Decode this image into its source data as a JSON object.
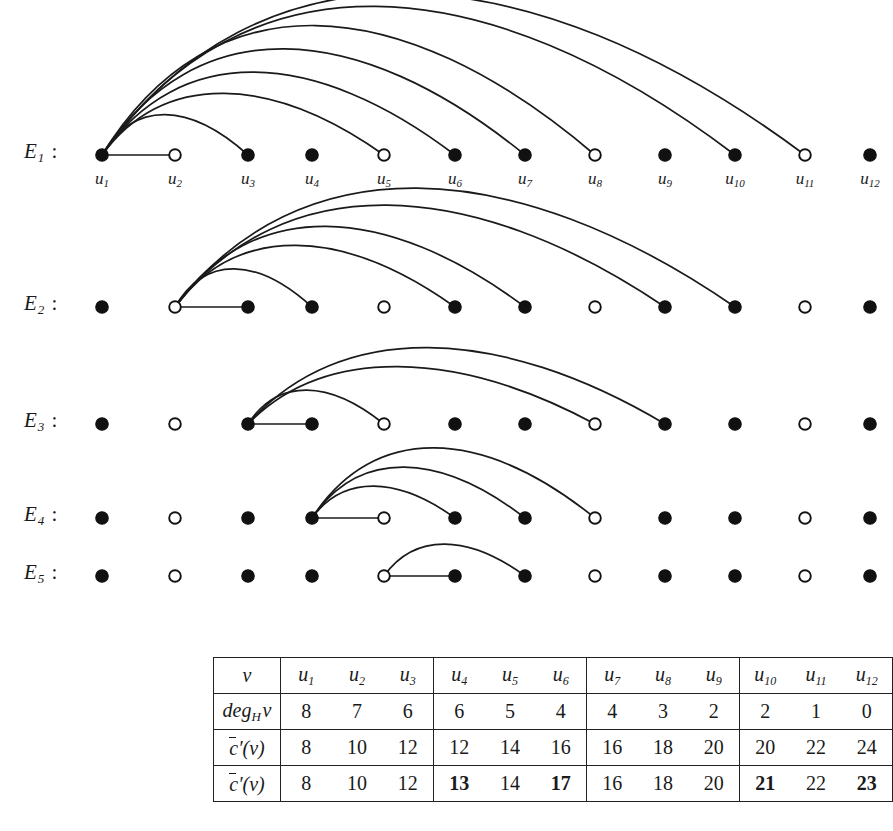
{
  "figure": {
    "vertex_labels": [
      "u1",
      "u2",
      "u3",
      "u4",
      "u5",
      "u6",
      "u7",
      "u8",
      "u9",
      "u10",
      "u11",
      "u12"
    ],
    "vertex_label_base": "u",
    "vertex_label_subs": [
      "1",
      "2",
      "3",
      "4",
      "5",
      "6",
      "7",
      "8",
      "9",
      "10",
      "11",
      "12"
    ],
    "vertex_x": [
      102,
      175,
      248,
      312,
      384,
      455,
      525,
      595,
      665,
      735,
      805,
      870
    ],
    "vertex_fill": [
      "filled",
      "open",
      "filled",
      "filled",
      "open",
      "filled",
      "filled",
      "open",
      "filled",
      "filled",
      "open",
      "filled"
    ],
    "node_colors": {
      "filled": "#111111",
      "open": "#ffffff",
      "stroke": "#111111"
    },
    "edge_color": "#1a1a1a",
    "rows": [
      {
        "id": "E1",
        "label_base": "E",
        "label_sub": "1",
        "colon": ":",
        "baseline_y": 155,
        "source_index": 0,
        "straight_targets": [
          1
        ],
        "arc_targets": [
          2,
          4,
          5,
          6,
          7,
          9,
          10
        ],
        "arc_apex_offsets": [
          38,
          58,
          78,
          100,
          122,
          140,
          152
        ]
      },
      {
        "id": "E2",
        "label_base": "E",
        "label_sub": "2",
        "colon": ":",
        "baseline_y": 307,
        "source_index": 1,
        "straight_targets": [
          2
        ],
        "arc_targets": [
          3,
          5,
          6,
          8,
          9
        ],
        "arc_apex_offsets": [
          36,
          58,
          76,
          96,
          112
        ]
      },
      {
        "id": "E3",
        "label_base": "E",
        "label_sub": "3",
        "colon": ":",
        "baseline_y": 424,
        "source_index": 2,
        "straight_targets": [
          3
        ],
        "arc_targets": [
          4,
          7,
          8
        ],
        "arc_apex_offsets": [
          32,
          54,
          72
        ]
      },
      {
        "id": "E4",
        "label_base": "E",
        "label_sub": "4",
        "colon": ":",
        "baseline_y": 518,
        "source_index": 3,
        "straight_targets": [
          4
        ],
        "arc_targets": [
          5,
          6,
          7
        ],
        "arc_apex_offsets": [
          30,
          48,
          66
        ]
      },
      {
        "id": "E5",
        "label_base": "E",
        "label_sub": "5",
        "colon": ":",
        "baseline_y": 576,
        "source_index": 4,
        "straight_targets": [
          5
        ],
        "arc_targets": [
          6
        ],
        "arc_apex_offsets": [
          30
        ]
      }
    ]
  },
  "table": {
    "row_labels": {
      "header": "v",
      "degree": "deg",
      "degree_sub": "H",
      "degree_var": "v",
      "c1_prefix": "c",
      "c1_suffix": "′(v)",
      "c2_prefix": "c",
      "c2_suffix": "′(v)"
    },
    "groups": [
      {
        "headers": [
          "u1",
          "u2",
          "u3"
        ],
        "head_base": [
          "u",
          "u",
          "u"
        ],
        "head_sub": [
          "1",
          "2",
          "3"
        ],
        "degree": [
          "8",
          "7",
          "6"
        ],
        "degree_bold": [
          false,
          false,
          false
        ],
        "c1": [
          "8",
          "10",
          "12"
        ],
        "c1_bold": [
          false,
          false,
          false
        ],
        "c2": [
          "8",
          "10",
          "12"
        ],
        "c2_bold": [
          false,
          false,
          false
        ]
      },
      {
        "headers": [
          "u4",
          "u5",
          "u6"
        ],
        "head_base": [
          "u",
          "u",
          "u"
        ],
        "head_sub": [
          "4",
          "5",
          "6"
        ],
        "degree": [
          "6",
          "5",
          "4"
        ],
        "degree_bold": [
          false,
          false,
          false
        ],
        "c1": [
          "12",
          "14",
          "16"
        ],
        "c1_bold": [
          false,
          false,
          false
        ],
        "c2": [
          "13",
          "14",
          "17"
        ],
        "c2_bold": [
          true,
          false,
          true
        ]
      },
      {
        "headers": [
          "u7",
          "u8",
          "u9"
        ],
        "head_base": [
          "u",
          "u",
          "u"
        ],
        "head_sub": [
          "7",
          "8",
          "9"
        ],
        "degree": [
          "4",
          "3",
          "2"
        ],
        "degree_bold": [
          false,
          false,
          false
        ],
        "c1": [
          "16",
          "18",
          "20"
        ],
        "c1_bold": [
          false,
          false,
          false
        ],
        "c2": [
          "16",
          "18",
          "20"
        ],
        "c2_bold": [
          false,
          false,
          false
        ]
      },
      {
        "headers": [
          "u10",
          "u11",
          "u12"
        ],
        "head_base": [
          "u",
          "u",
          "u"
        ],
        "head_sub": [
          "10",
          "11",
          "12"
        ],
        "degree": [
          "2",
          "1",
          "0"
        ],
        "degree_bold": [
          false,
          false,
          false
        ],
        "c1": [
          "20",
          "22",
          "24"
        ],
        "c1_bold": [
          false,
          false,
          false
        ],
        "c2": [
          "21",
          "22",
          "23"
        ],
        "c2_bold": [
          true,
          false,
          true
        ]
      }
    ]
  }
}
